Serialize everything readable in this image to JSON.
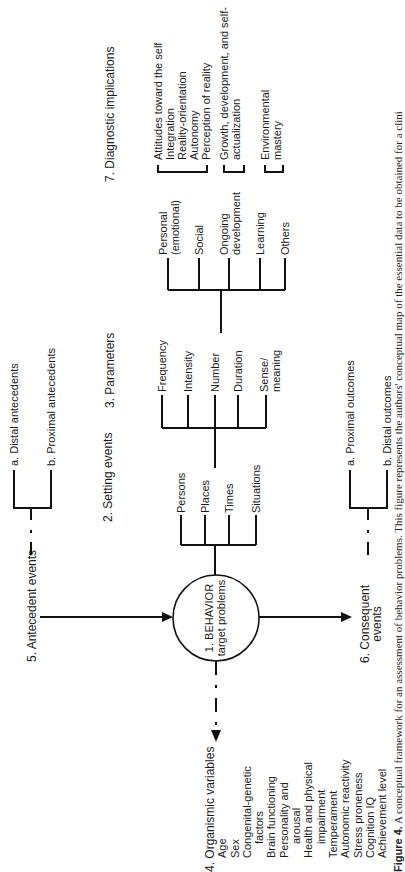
{
  "figure": {
    "caption_label": "Figure 4.",
    "caption_text": "A conceptual framework for an assessment of behavior problems. This figure represents the authors' conceptual map of the essential data to be obtained for a clini"
  },
  "nodes": {
    "behavior": {
      "line1": "1.  BEHAVIOR",
      "line2": "target problems"
    },
    "setting_events": {
      "title": "2.  Setting events",
      "items": [
        "Persons",
        "Places",
        "Times",
        "Situations"
      ]
    },
    "parameters": {
      "title": "3.  Parameters",
      "items": [
        "Frequency",
        "Intensity",
        "Number",
        "Duration",
        "Sense/",
        "meaning"
      ]
    },
    "domains": {
      "items": [
        "Personal",
        "(emotional)",
        "Social",
        "Ongoing",
        "development",
        "Learning",
        "Others"
      ]
    },
    "organismic": {
      "title": "4.  Organismic variables",
      "items": [
        "Age",
        "Sex",
        "Congenital-genetic",
        "factors",
        "Brain functioning",
        "Personality and",
        "arousal",
        "Health and physical",
        "impairment",
        "Temperament",
        "Autonomic reactivity",
        "Stress proneness",
        "Cognition IQ",
        "Achievement level"
      ]
    },
    "antecedent": {
      "title": "5.  Antecedent events",
      "a": "a.  Distal antecedents",
      "b": "b.  Proximal antecedents"
    },
    "consequent": {
      "title_1": "6.  Consequent",
      "title_2": "events",
      "a": "a.  Proximal outcomes",
      "b": "b.  Distal outcomes"
    },
    "diagnostic": {
      "title": "7.  Diagnostic implications",
      "group1": [
        "Attitudes toward the self",
        "Integration",
        "Reality-orientation",
        "Autonomy",
        "Perception of reality"
      ],
      "group2": [
        "Growth, development, and self-",
        "actualization"
      ],
      "group3": [
        "Environmental",
        "mastery"
      ]
    }
  }
}
